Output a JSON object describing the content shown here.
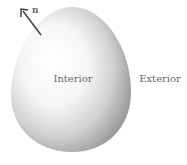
{
  "diagram": {
    "normal_label": "n",
    "interior_label": "Interior",
    "exterior_label": "Exterior",
    "colors": {
      "arrow": "#3a3a3a",
      "text": "#6a6a6a",
      "shade_light": "#ffffff",
      "shade_dark": "#8a8a8a"
    }
  }
}
